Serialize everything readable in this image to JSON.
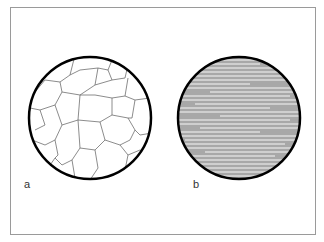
{
  "figure": {
    "panels": [
      {
        "label": "a",
        "description": "equiaxed grain structure"
      },
      {
        "label": "b",
        "description": "elongated striated grain structure"
      }
    ],
    "colors": {
      "outline": "#000000",
      "grain_boundary": "#6e6e6e",
      "stripe_fill": "#a8a8a8",
      "frame": "#9a9a9a"
    }
  }
}
